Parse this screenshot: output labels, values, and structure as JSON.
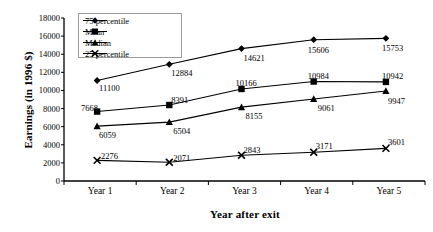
{
  "chart_data": {
    "type": "line",
    "title": "",
    "xlabel": "Year after exit",
    "ylabel": "Earnings (in 1996 $)",
    "categories": [
      "Year 1",
      "Year 2",
      "Year 3",
      "Year 4",
      "Year 5"
    ],
    "ylim": [
      0,
      18000
    ],
    "yticks": [
      0,
      2000,
      4000,
      6000,
      8000,
      10000,
      12000,
      14000,
      16000,
      18000
    ],
    "ytick_labels": [
      "0",
      "2000",
      "4000",
      "6000",
      "8000",
      "10000",
      "12000",
      "14000",
      "16000",
      "18000"
    ],
    "grid": false,
    "legend_position": "upper-left-inside",
    "series": [
      {
        "name": "75 percentile",
        "marker": "diamond",
        "values": [
          11100,
          12884,
          14621,
          15606,
          15753
        ],
        "labels": [
          "11100",
          "12884",
          "14621",
          "15606",
          "15753"
        ]
      },
      {
        "name": "Mean",
        "marker": "square",
        "values": [
          7668,
          8391,
          10166,
          10984,
          10942
        ],
        "labels": [
          "7668",
          "8391",
          "10166",
          "10984",
          "10942"
        ]
      },
      {
        "name": "Median",
        "marker": "triangle",
        "values": [
          6059,
          6504,
          8155,
          9061,
          9947
        ],
        "labels": [
          "6059",
          "6504",
          "8155",
          "9061",
          "9947"
        ]
      },
      {
        "name": "25 percentile",
        "marker": "x",
        "values": [
          2276,
          2071,
          2843,
          3171,
          3601
        ],
        "labels": [
          "2276",
          "2071",
          "2843",
          "3171",
          "3601"
        ]
      }
    ]
  },
  "axes": {
    "y_title": "Earnings (in 1996 $)",
    "x_title": "Year after exit"
  },
  "legend": {
    "items": [
      {
        "label": "75 percentile"
      },
      {
        "label": "Mean"
      },
      {
        "label": "Median"
      },
      {
        "label": "25 percentile"
      }
    ]
  },
  "colors": {
    "line": "#000000",
    "axis": "#000000",
    "legend_border": "#9a9a9a",
    "background": "#ffffff"
  }
}
